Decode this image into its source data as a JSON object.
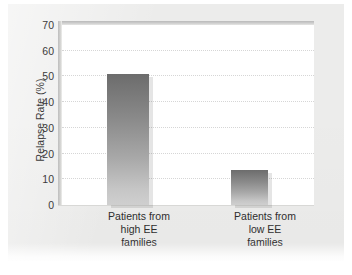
{
  "chart_data": {
    "type": "bar",
    "title": "",
    "subtitle": "",
    "xlabel": "",
    "ylabel": "Relapse Rate (%)",
    "categories": [
      "Patients from high EE families",
      "Patients from low EE families"
    ],
    "category_lines": [
      [
        "Patients from",
        "high EE",
        "families"
      ],
      [
        "Patients from",
        "low EE",
        "families"
      ]
    ],
    "values": [
      51,
      13.5
    ],
    "ylim": [
      0,
      70
    ],
    "yticks": [
      0,
      10,
      20,
      30,
      40,
      50,
      60,
      70
    ],
    "ytick_labels": [
      "0",
      "10",
      "20",
      "30",
      "40",
      "50",
      "60",
      "70"
    ],
    "grid": true,
    "grid_axis": "y",
    "legend": null,
    "legend_position": "none",
    "bar_fill_top": "#6c6c6c",
    "bar_fill_bottom": "#cfcfcf",
    "plot_background": "#ffffff",
    "figure_background": "#ececeb",
    "text_color": "#2e2e2e",
    "gridline_color": "#d6d6d6"
  },
  "axes": {
    "y_axis_title": "Relapse Rate (%)"
  }
}
